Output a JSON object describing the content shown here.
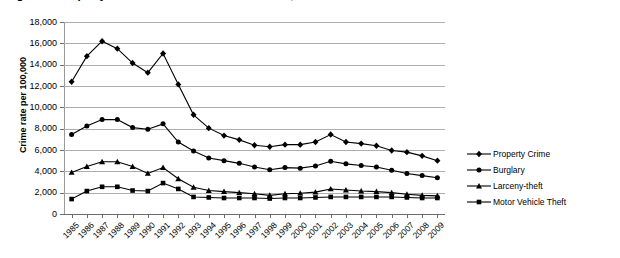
{
  "chart_data": {
    "type": "line",
    "title": "Figure 1.  Property Crime Rates in the United States, 1985-2009",
    "xlabel": "",
    "ylabel": "Crime rate per 100,000",
    "x": [
      1985,
      1986,
      1987,
      1988,
      1989,
      1990,
      1991,
      1992,
      1993,
      1994,
      1995,
      1996,
      1997,
      1998,
      1999,
      2000,
      2001,
      2002,
      2003,
      2004,
      2005,
      2006,
      2007,
      2008,
      2009
    ],
    "categories": [
      "1985",
      "1986",
      "1987",
      "1988",
      "1989",
      "1990",
      "1991",
      "1992",
      "1993",
      "1994",
      "1995",
      "1996",
      "1997",
      "1998",
      "1999",
      "2000",
      "2001",
      "2002",
      "2003",
      "2004",
      "2005",
      "2006",
      "2007",
      "2008",
      "2009"
    ],
    "ylim": [
      0,
      18000
    ],
    "yticks": [
      0,
      2000,
      4000,
      6000,
      8000,
      10000,
      12000,
      14000,
      16000,
      18000
    ],
    "ytick_labels": [
      "0",
      "2,000",
      "4,000",
      "6,000",
      "8,000",
      "10,000",
      "12,000",
      "14,000",
      "16,000",
      "18,000"
    ],
    "grid": true,
    "legend_position": "right",
    "series": [
      {
        "name": "Property Crime",
        "marker": "diamond",
        "color": "#000000",
        "values": [
          12400,
          14800,
          16200,
          15500,
          14150,
          13250,
          15050,
          12150,
          9300,
          8050,
          7350,
          6950,
          6450,
          6300,
          6500,
          6500,
          6750,
          7450,
          6750,
          6600,
          6400,
          5950,
          5800,
          5450,
          5000
        ]
      },
      {
        "name": "Burglary",
        "marker": "circle",
        "color": "#000000",
        "values": [
          7450,
          8250,
          8850,
          8850,
          8100,
          7950,
          8450,
          6750,
          5900,
          5250,
          5000,
          4750,
          4400,
          4150,
          4350,
          4300,
          4500,
          4950,
          4700,
          4550,
          4400,
          4100,
          3800,
          3600,
          3400
        ]
      },
      {
        "name": "Larceny-theft",
        "marker": "triangle",
        "color": "#000000",
        "values": [
          3900,
          4450,
          4900,
          4900,
          4450,
          3800,
          4350,
          3300,
          2500,
          2200,
          2100,
          2000,
          1900,
          1750,
          1900,
          1950,
          2050,
          2350,
          2250,
          2150,
          2100,
          2000,
          1850,
          1750,
          1700
        ]
      },
      {
        "name": "Motor Vehicle Theft",
        "marker": "square",
        "color": "#000000",
        "values": [
          1400,
          2150,
          2550,
          2550,
          2200,
          2150,
          2900,
          2350,
          1600,
          1550,
          1500,
          1500,
          1500,
          1450,
          1500,
          1500,
          1550,
          1600,
          1600,
          1600,
          1600,
          1600,
          1550,
          1500,
          1500
        ]
      }
    ]
  },
  "legend": {
    "items": [
      {
        "label": "Property Crime"
      },
      {
        "label": "Burglary"
      },
      {
        "label": "Larceny-theft"
      },
      {
        "label": "Motor Vehicle Theft"
      }
    ]
  }
}
